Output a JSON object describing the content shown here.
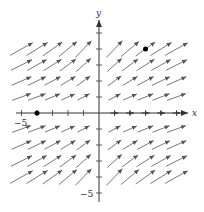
{
  "figure": {
    "type": "vector-field",
    "x_axis_label": "x",
    "y_axis_label": "y",
    "x_min_label": "−5",
    "y_min_label": "−5",
    "x_range": [
      -5,
      5
    ],
    "y_range": [
      -5,
      5
    ],
    "tick_step": 1,
    "colors": {
      "axes": "#333333",
      "arrows": "#555555",
      "points": "#000000",
      "background": "#ffffff"
    },
    "marked_points": [
      {
        "x": -4,
        "y": 0
      },
      {
        "x": 3,
        "y": 4
      }
    ],
    "grid_points_x": [
      -5,
      -4,
      -3,
      -2,
      -1,
      1,
      2,
      3,
      4,
      5
    ],
    "grid_points_y": [
      -4,
      -3,
      -2,
      -1,
      1,
      2,
      3,
      4
    ]
  }
}
